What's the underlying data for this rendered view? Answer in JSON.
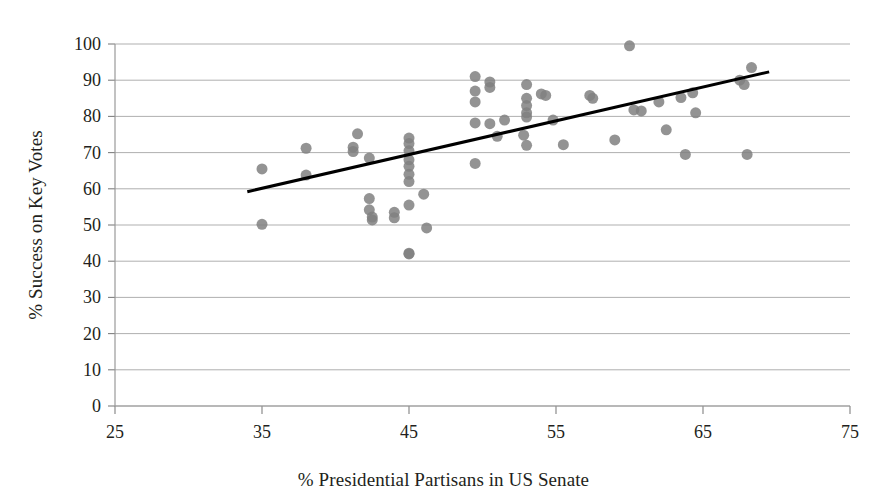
{
  "chart_data": {
    "type": "scatter",
    "title": "",
    "xlabel": "% Presidential Partisans in US Senate",
    "ylabel": "% Success on Key Votes",
    "xlim": [
      25,
      75
    ],
    "ylim": [
      0,
      100
    ],
    "xticks": [
      25,
      35,
      45,
      55,
      65,
      75
    ],
    "yticks": [
      0,
      10,
      20,
      30,
      40,
      50,
      60,
      70,
      80,
      90,
      100
    ],
    "grid": "horizontal",
    "legend": "none",
    "marker": {
      "shape": "circle",
      "color": "#808080",
      "size": 11,
      "opacity": 0.85
    },
    "trendline": {
      "type": "linear",
      "color": "#000000",
      "width": 3,
      "x_start": 34.0,
      "y_start": 59.2,
      "x_end": 69.5,
      "y_end": 92.3
    },
    "points": [
      {
        "x": 35.0,
        "y": 65.5
      },
      {
        "x": 35.0,
        "y": 50.2
      },
      {
        "x": 38.0,
        "y": 71.2
      },
      {
        "x": 38.0,
        "y": 63.8
      },
      {
        "x": 41.5,
        "y": 75.2
      },
      {
        "x": 41.2,
        "y": 71.5
      },
      {
        "x": 41.2,
        "y": 70.3
      },
      {
        "x": 42.3,
        "y": 68.5
      },
      {
        "x": 42.3,
        "y": 57.3
      },
      {
        "x": 42.3,
        "y": 54.2
      },
      {
        "x": 42.5,
        "y": 52.2
      },
      {
        "x": 42.5,
        "y": 51.4
      },
      {
        "x": 44.0,
        "y": 53.5
      },
      {
        "x": 44.0,
        "y": 52.0
      },
      {
        "x": 45.0,
        "y": 74.0
      },
      {
        "x": 45.0,
        "y": 72.5
      },
      {
        "x": 45.0,
        "y": 70.5
      },
      {
        "x": 45.0,
        "y": 68.0
      },
      {
        "x": 45.0,
        "y": 66.2
      },
      {
        "x": 45.0,
        "y": 64.0
      },
      {
        "x": 45.0,
        "y": 62.0
      },
      {
        "x": 45.0,
        "y": 55.5
      },
      {
        "x": 45.0,
        "y": 42.2
      },
      {
        "x": 45.0,
        "y": 42.0
      },
      {
        "x": 46.0,
        "y": 58.5
      },
      {
        "x": 46.2,
        "y": 49.2
      },
      {
        "x": 49.5,
        "y": 91.0
      },
      {
        "x": 49.5,
        "y": 87.0
      },
      {
        "x": 49.5,
        "y": 84.0
      },
      {
        "x": 49.5,
        "y": 78.2
      },
      {
        "x": 49.5,
        "y": 67.0
      },
      {
        "x": 50.5,
        "y": 89.5
      },
      {
        "x": 50.5,
        "y": 88.0
      },
      {
        "x": 50.5,
        "y": 78.0
      },
      {
        "x": 51.5,
        "y": 79.0
      },
      {
        "x": 51.0,
        "y": 74.5
      },
      {
        "x": 52.8,
        "y": 74.8
      },
      {
        "x": 53.0,
        "y": 88.8
      },
      {
        "x": 53.0,
        "y": 85.0
      },
      {
        "x": 53.0,
        "y": 83.0
      },
      {
        "x": 53.0,
        "y": 81.0
      },
      {
        "x": 53.0,
        "y": 79.8
      },
      {
        "x": 53.0,
        "y": 72.0
      },
      {
        "x": 54.0,
        "y": 86.2
      },
      {
        "x": 54.3,
        "y": 85.8
      },
      {
        "x": 54.8,
        "y": 79.0
      },
      {
        "x": 55.5,
        "y": 72.2
      },
      {
        "x": 57.3,
        "y": 85.8
      },
      {
        "x": 57.5,
        "y": 85.0
      },
      {
        "x": 59.0,
        "y": 73.5
      },
      {
        "x": 60.0,
        "y": 99.5
      },
      {
        "x": 60.3,
        "y": 81.8
      },
      {
        "x": 60.8,
        "y": 81.5
      },
      {
        "x": 62.0,
        "y": 84.0
      },
      {
        "x": 62.5,
        "y": 76.3
      },
      {
        "x": 63.5,
        "y": 85.2
      },
      {
        "x": 63.8,
        "y": 69.5
      },
      {
        "x": 64.3,
        "y": 86.5
      },
      {
        "x": 64.5,
        "y": 81.0
      },
      {
        "x": 67.5,
        "y": 90.0
      },
      {
        "x": 67.8,
        "y": 88.8
      },
      {
        "x": 68.3,
        "y": 93.5
      },
      {
        "x": 68.0,
        "y": 69.5
      }
    ]
  },
  "colors": {
    "marker": "#808080",
    "trendline": "#000000",
    "gridline": "#a6a6a6",
    "axis": "#808080",
    "text": "#231f20"
  }
}
